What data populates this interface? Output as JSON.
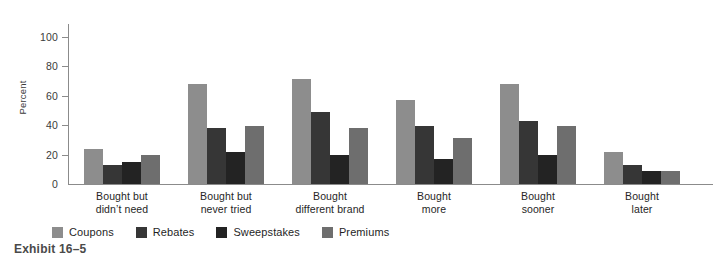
{
  "caption": "Exhibit 16–5",
  "axis": {
    "y_title": "Percent",
    "y_ticks": [
      "0",
      "20",
      "40",
      "60",
      "80",
      "100"
    ]
  },
  "legend": {
    "items": [
      {
        "label": "Coupons",
        "color": "#8d8d8d"
      },
      {
        "label": "Rebates",
        "color": "#363636"
      },
      {
        "label": "Sweepstakes",
        "color": "#232323"
      },
      {
        "label": "Premiums",
        "color": "#6e6e6e"
      }
    ]
  },
  "categories_display": [
    {
      "line1": "Bought but",
      "line2": "didn’t need"
    },
    {
      "line1": "Bought but",
      "line2": "never tried"
    },
    {
      "line1": "Bought",
      "line2": "different brand"
    },
    {
      "line1": "Bought",
      "line2": "more"
    },
    {
      "line1": "Bought",
      "line2": "sooner"
    },
    {
      "line1": "Bought",
      "line2": "later"
    }
  ],
  "chart_data": {
    "type": "bar",
    "title": "",
    "subtitle": "",
    "xlabel": "",
    "ylabel": "Percent",
    "ylim": [
      0,
      100
    ],
    "yticks": [
      0,
      20,
      40,
      60,
      80,
      100
    ],
    "grid": false,
    "legend_position": "bottom-left",
    "categories": [
      "Bought but didn’t need",
      "Bought but never tried",
      "Bought different brand",
      "Bought more",
      "Bought sooner",
      "Bought later"
    ],
    "series": [
      {
        "name": "Coupons",
        "color": "#8d8d8d",
        "values": [
          24,
          68,
          71,
          57,
          68,
          22
        ]
      },
      {
        "name": "Rebates",
        "color": "#363636",
        "values": [
          13,
          38,
          49,
          39,
          43,
          13
        ]
      },
      {
        "name": "Sweepstakes",
        "color": "#232323",
        "values": [
          15,
          22,
          20,
          17,
          20,
          9
        ]
      },
      {
        "name": "Premiums",
        "color": "#6e6e6e",
        "values": [
          20,
          39,
          38,
          31,
          39,
          9
        ]
      }
    ]
  }
}
